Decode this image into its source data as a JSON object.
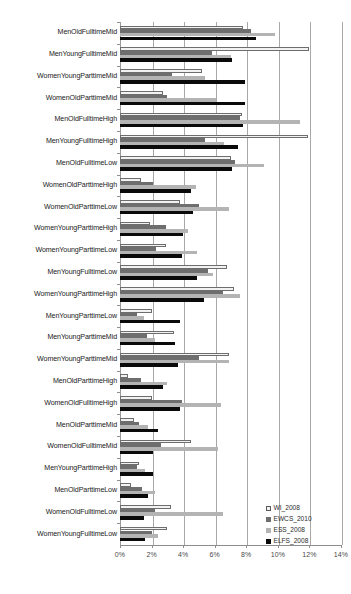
{
  "chart_data": {
    "type": "bar",
    "orientation": "horizontal",
    "title": "",
    "xlabel": "",
    "ylabel": "",
    "xlim": [
      0,
      14
    ],
    "xticks": [
      "0%",
      "2%",
      "4%",
      "6%",
      "8%",
      "10%",
      "12%",
      "14%"
    ],
    "xtick_values": [
      0,
      2,
      4,
      6,
      8,
      10,
      12,
      14
    ],
    "grid": true,
    "legend_position": "bottom-right",
    "categories": [
      "MenOldFulltimeMid",
      "MenYoungFulltimeMid",
      "WomenYoungParttimeMid",
      "WomenOldParttimeMid",
      "MenOldFulltimeHigh",
      "MenYoungFulltimeHigh",
      "MenOldFulltimeLow",
      "WomenOldParttimeHigh",
      "WomenOldParttimeLow",
      "WomenYoungParttimeHigh",
      "WomenYoungParttimeLow",
      "MenYoungFulltimeLow",
      "WomenYoungParttimeHigh",
      "MenYoungParttimeLow",
      "MenYoungParttimeMid",
      "WomenYoungParttimeMid",
      "MenOldParttimeHigh",
      "WomenOldFulltimeHigh",
      "MenOldParttimeMid",
      "WomenOldFulltimeMid",
      "MenYoungParttimeHigh",
      "MenOldParttimeLow",
      "WomenOldFulltimeLow",
      "WomenYoungFulltimeLow"
    ],
    "series": [
      {
        "name": "WI_2008",
        "color": "#f2f2f2",
        "values": [
          7.8,
          12.0,
          5.2,
          2.7,
          7.7,
          11.9,
          7.0,
          1.3,
          3.8,
          1.9,
          2.9,
          6.8,
          7.2,
          2.0,
          3.4,
          6.9,
          0.5,
          2.0,
          0.9,
          4.5,
          1.2,
          0.7,
          3.2,
          3.0
        ]
      },
      {
        "name": "EWCS_2010",
        "color": "#6e6e6e",
        "values": [
          8.3,
          5.8,
          3.3,
          3.0,
          7.6,
          5.4,
          7.3,
          2.1,
          5.0,
          2.9,
          2.3,
          5.6,
          6.5,
          1.1,
          1.7,
          5.0,
          1.3,
          3.9,
          1.2,
          2.6,
          1.1,
          1.4,
          2.2,
          2.0
        ]
      },
      {
        "name": "ESS_2008",
        "color": "#b4b4b4",
        "values": [
          9.8,
          7.0,
          5.4,
          6.1,
          11.4,
          6.6,
          9.1,
          4.8,
          6.9,
          4.3,
          4.9,
          5.9,
          7.6,
          1.5,
          2.2,
          6.9,
          3.0,
          6.4,
          1.8,
          6.2,
          1.6,
          2.2,
          6.5,
          2.4
        ]
      },
      {
        "name": "ELFS_2008",
        "color": "#0a0a0a",
        "values": [
          8.6,
          7.1,
          7.9,
          7.9,
          7.8,
          7.5,
          7.1,
          4.5,
          4.6,
          4.0,
          3.9,
          4.9,
          5.3,
          3.8,
          3.5,
          3.7,
          2.7,
          3.8,
          2.4,
          2.1,
          2.1,
          1.8,
          1.5,
          1.6
        ]
      }
    ]
  },
  "legend": {
    "items": [
      {
        "label": "WI_2008"
      },
      {
        "label": "EWCS_2010"
      },
      {
        "label": "ESS_2008"
      },
      {
        "label": "ELFS_2008"
      }
    ]
  }
}
